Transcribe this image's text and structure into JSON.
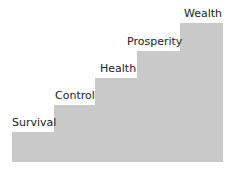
{
  "diagram": {
    "type": "staircase",
    "fill_color": "#c9c9c9",
    "text_color": "#222222",
    "steps": [
      {
        "label": "Survival"
      },
      {
        "label": "Control"
      },
      {
        "label": "Health"
      },
      {
        "label": "Prosperity"
      },
      {
        "label": "Wealth"
      }
    ]
  }
}
